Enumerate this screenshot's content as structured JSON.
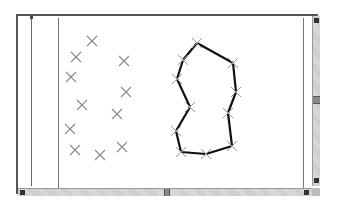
{
  "window": {
    "title": "",
    "scrollbars": {
      "vertical_thumb_pos": 0.5,
      "horizontal_thumb_pos": 0.5
    }
  },
  "canvas": {
    "marker_color": "#888888",
    "polygon_color": "#111111",
    "scatter_points": [
      [
        92,
        41
      ],
      [
        76,
        57
      ],
      [
        124,
        61
      ],
      [
        71,
        77
      ],
      [
        126,
        92
      ],
      [
        82,
        105
      ],
      [
        117,
        114
      ],
      [
        70,
        129
      ],
      [
        75,
        150
      ],
      [
        100,
        155
      ],
      [
        122,
        147
      ]
    ],
    "polygon_points": [
      [
        197,
        43
      ],
      [
        233,
        63
      ],
      [
        236,
        92
      ],
      [
        228,
        113
      ],
      [
        232,
        146
      ],
      [
        206,
        154
      ],
      [
        181,
        152
      ],
      [
        176,
        131
      ],
      [
        190,
        107
      ],
      [
        177,
        79
      ],
      [
        183,
        60
      ]
    ]
  },
  "icons": {
    "scroll_up": "arrow-up-icon",
    "scroll_down": "arrow-down-icon",
    "scroll_left": "arrow-left-icon",
    "scroll_right": "arrow-right-icon"
  }
}
